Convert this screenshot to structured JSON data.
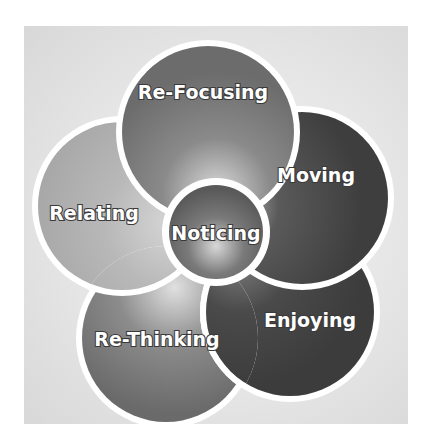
{
  "diagram": {
    "type": "overlapping-circles-cycle",
    "center": {
      "label": "Noticing",
      "fill": "#6e6e6e"
    },
    "petals": [
      {
        "label": "Re-Focusing",
        "fill": "#7a7a7a"
      },
      {
        "label": "Moving",
        "fill": "#4a4a4a"
      },
      {
        "label": "Enjoying",
        "fill": "#454545"
      },
      {
        "label": "Re-Thinking",
        "fill": "#7c7c7c"
      },
      {
        "label": "Relating",
        "fill": "#b4b4b4"
      }
    ],
    "colors": {
      "background": "#e4e4e4",
      "ring": "#ffffff",
      "text": "#ffffff",
      "text_outline": "#3a3a3a"
    }
  }
}
